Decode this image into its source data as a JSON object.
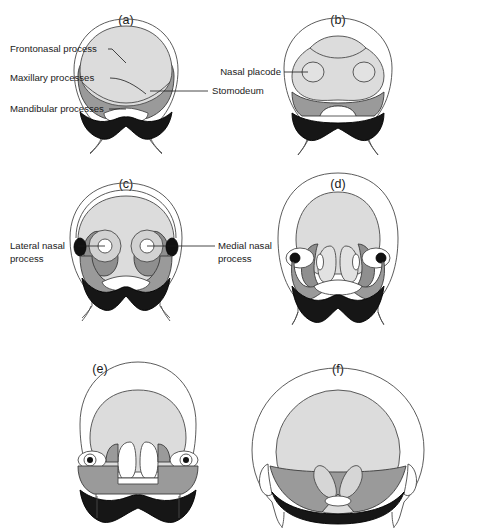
{
  "figure": {
    "background_color": "#ffffff",
    "width": 483,
    "height": 529
  },
  "legend_colors": {
    "frontonasal_process": "#dcdcdc",
    "nasal_placode": "#dcdcdc",
    "medial_nasal_process": "#d2d2d2",
    "lateral_nasal_process": "#8f8f8f",
    "maxillary_process": "#9a9a9a",
    "mandibular_process": "#161616",
    "stomodeum": "#ffffff",
    "eye": "#111111",
    "outline_stroke": "#4a4a4a"
  },
  "panels": [
    {
      "id": "a",
      "label": "(a)",
      "annotations": [
        {
          "id": "frontonasal-process",
          "text": "Frontonasal process"
        },
        {
          "id": "maxillary-processes",
          "text": "Maxillary processes"
        },
        {
          "id": "mandibular-processes",
          "text": "Mandibular processes"
        },
        {
          "id": "stomodeum",
          "text": "Stomodeum"
        }
      ]
    },
    {
      "id": "b",
      "label": "(b)",
      "annotations": [
        {
          "id": "nasal-placode",
          "text": "Nasal placode"
        }
      ]
    },
    {
      "id": "c",
      "label": "(c)",
      "annotations": [
        {
          "id": "lateral-nasal-process",
          "text": "Lateral nasal process"
        },
        {
          "id": "medial-nasal-process",
          "text": "Medial nasal process"
        }
      ]
    },
    {
      "id": "d",
      "label": "(d)",
      "annotations": []
    },
    {
      "id": "e",
      "label": "(e)",
      "annotations": []
    },
    {
      "id": "f",
      "label": "(f)",
      "annotations": []
    }
  ],
  "annotation_text": {
    "frontonasal_process": "Frontonasal process",
    "maxillary_processes": "Maxillary processes",
    "mandibular_processes": "Mandibular processes",
    "stomodeum": "Stomodeum",
    "nasal_placode": "Nasal placode",
    "lateral_nasal_line1": "Lateral nasal",
    "lateral_nasal_line2": "process",
    "medial_nasal_line1": "Medial nasal",
    "medial_nasal_line2": "process"
  },
  "panel_labels": {
    "a": "(a)",
    "b": "(b)",
    "c": "(c)",
    "d": "(d)",
    "e": "(e)",
    "f": "(f)"
  }
}
